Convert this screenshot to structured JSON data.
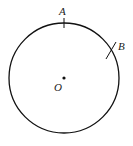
{
  "diagram": {
    "type": "circle-with-points",
    "circle": {
      "cx": 64,
      "cy": 78,
      "r": 55,
      "stroke": "#111111"
    },
    "center": {
      "label": "O",
      "x": 64,
      "y": 78
    },
    "points": [
      {
        "label": "A",
        "tick": {
          "x1": 64,
          "y1": 18,
          "x2": 64,
          "y2": 28
        }
      },
      {
        "label": "B",
        "tick": {
          "x1": 106,
          "y1": 59,
          "x2": 116,
          "y2": 42
        }
      }
    ]
  }
}
